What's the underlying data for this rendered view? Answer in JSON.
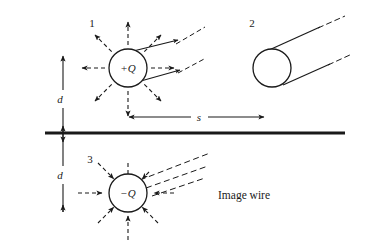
{
  "figure": {
    "type": "physics-diagram",
    "background_color": "#ffffff",
    "ink_color": "#1a1a1a",
    "width": 366,
    "height": 249
  },
  "labels": {
    "item_1": "1",
    "item_2": "2",
    "item_3": "3",
    "charge_positive": "+Q",
    "charge_negative": "−Q",
    "distance_above": "d",
    "distance_below": "d",
    "separation": "s",
    "image_wire": "Image wire"
  },
  "objects": {
    "wire_1": {
      "name": "charged-wire-cross-section",
      "label": "+Q",
      "center": [
        128,
        68
      ],
      "radius": 19,
      "field_arrows": 8,
      "arrow_direction": "outward",
      "arrow_style": "dashed"
    },
    "wire_2": {
      "name": "wire-perspective-view",
      "label": "2",
      "center": [
        272,
        68
      ],
      "radius": 19,
      "tangent_lines": 2,
      "tangent_style": "solid-then-dashed"
    },
    "wire_3": {
      "name": "image-wire-cross-section",
      "label": "−Q",
      "center": [
        128,
        193
      ],
      "radius": 19,
      "field_arrows": 8,
      "arrow_direction": "inward",
      "arrow_style": "dashed"
    },
    "ground_plane": {
      "name": "conducting-plane",
      "y": 133,
      "x_start": 45,
      "x_end": 345,
      "thickness": 3
    }
  },
  "dimensions": {
    "d_above": {
      "label": "d",
      "from": [
        63,
        60
      ],
      "to": [
        63,
        133
      ]
    },
    "d_below": {
      "label": "d",
      "from": [
        63,
        133
      ],
      "to": [
        63,
        212
      ]
    },
    "s_horizontal": {
      "label": "s",
      "from": [
        128,
        117
      ],
      "to": [
        265,
        117
      ]
    }
  },
  "geometry": {
    "arrow_angles_deg": [
      90,
      45,
      0,
      315,
      270,
      225,
      180,
      135
    ],
    "inner_gap": 4,
    "outer_reach": 28
  }
}
